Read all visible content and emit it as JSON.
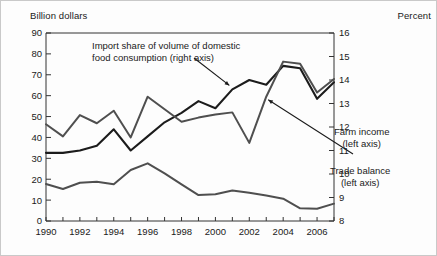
{
  "figure": {
    "left_axis_title": "Billion dollars",
    "right_axis_title": "Percent"
  },
  "annotations": {
    "import": {
      "line1": "Import share of volume of domestic",
      "line2": "food consumption (right axis)"
    },
    "farm": {
      "line1": "Farm income",
      "line2": "(left axis)"
    },
    "trade": {
      "line1": "Trade balance",
      "line2": "(left axis)"
    }
  },
  "chart_data": {
    "type": "line",
    "title": "",
    "xlabel": "",
    "ylabel": "Billion dollars",
    "y2label": "Percent",
    "grid": false,
    "legend": "annotations-inline",
    "x": [
      1990,
      1991,
      1992,
      1993,
      1994,
      1995,
      1996,
      1997,
      1998,
      1999,
      2000,
      2001,
      2002,
      2003,
      2004,
      2005,
      2006,
      2007
    ],
    "xtick_labels": [
      "1990",
      "",
      "1992",
      "",
      "1994",
      "",
      "1996",
      "",
      "1998",
      "",
      "2000",
      "",
      "2002",
      "",
      "2004",
      "",
      "2006",
      ""
    ],
    "xtick_values": [
      1990,
      1991,
      1992,
      1993,
      1994,
      1995,
      1996,
      1997,
      1998,
      1999,
      2000,
      2001,
      2002,
      2003,
      2004,
      2005,
      2006,
      2007
    ],
    "xlim": [
      1990,
      2007
    ],
    "ylim": [
      0,
      90
    ],
    "ytick_values": [
      0,
      10,
      20,
      30,
      40,
      50,
      60,
      70,
      80,
      90
    ],
    "ytick_labels": [
      "0",
      "10",
      "20",
      "30",
      "40",
      "50",
      "60",
      "70",
      "80",
      "90"
    ],
    "y2lim": [
      8,
      16
    ],
    "y2tick_values": [
      8,
      9,
      10,
      11,
      12,
      13,
      14,
      15,
      16
    ],
    "y2tick_labels": [
      "8",
      "9",
      "10",
      "11",
      "12",
      "13",
      "14",
      "15",
      "16"
    ],
    "series": [
      {
        "name": "Import share of volume of domestic food consumption",
        "axis": "right",
        "color": "#1c1c1c",
        "width": 2.1,
        "unit": "percent",
        "values": [
          10.9,
          10.9,
          11.0,
          11.2,
          11.9,
          11.0,
          11.6,
          12.2,
          12.6,
          13.1,
          12.8,
          13.6,
          14.0,
          13.8,
          14.6,
          14.5,
          13.2,
          13.9
        ]
      },
      {
        "name": "Farm income",
        "axis": "left",
        "color": "#4f4f4f",
        "width": 2.0,
        "unit": "billion dollars",
        "values": [
          46.3,
          40.5,
          50.7,
          46.8,
          52.8,
          40.0,
          59.5,
          53.5,
          47.5,
          49.5,
          51.0,
          52.0,
          37.4,
          59.5,
          76.3,
          75.3,
          61.5,
          68.0
        ]
      },
      {
        "name": "Trade balance",
        "axis": "left",
        "color": "#4f4f4f",
        "width": 2.0,
        "unit": "billion dollars",
        "values": [
          17.7,
          15.3,
          18.3,
          18.8,
          17.6,
          24.4,
          27.6,
          22.8,
          17.5,
          12.4,
          12.8,
          14.6,
          13.5,
          12.2,
          10.7,
          6.1,
          5.9,
          8.3
        ]
      }
    ],
    "annotation_arrows": [
      {
        "label": "Import share of volume of domestic food consumption (right axis)",
        "target_x": 2001,
        "target_value": 13.6
      },
      {
        "label": "Farm income (left axis)",
        "target_x": 2003,
        "target_value": 59.5
      }
    ]
  }
}
